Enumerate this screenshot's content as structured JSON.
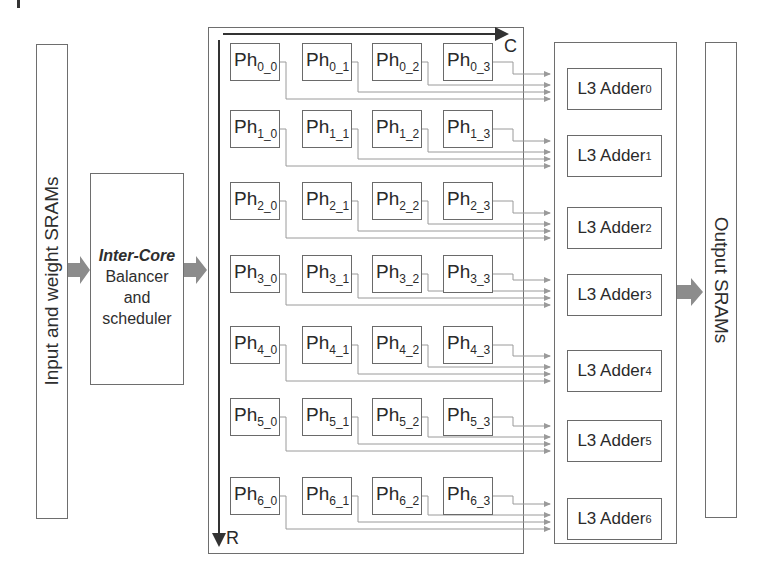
{
  "diagram": {
    "input_sram": {
      "label": "Input and weight SRAMs"
    },
    "balancer": {
      "title": "Inter-Core",
      "line1": "Balancer",
      "line2": "and",
      "line3": "scheduler"
    },
    "grid": {
      "col_axis_label": "C",
      "row_axis_label": "R",
      "prefix": "Ph",
      "rows": [
        [
          "0_0",
          "0_1",
          "0_2",
          "0_3"
        ],
        [
          "1_0",
          "1_1",
          "1_2",
          "1_3"
        ],
        [
          "2_0",
          "2_1",
          "2_2",
          "2_3"
        ],
        [
          "3_0",
          "3_1",
          "3_2",
          "3_3"
        ],
        [
          "4_0",
          "4_1",
          "4_2",
          "4_3"
        ],
        [
          "5_0",
          "5_1",
          "5_2",
          "5_3"
        ],
        [
          "6_0",
          "6_1",
          "6_2",
          "6_3"
        ]
      ]
    },
    "adders": {
      "label": "L3 Adder",
      "items": [
        {
          "sub": "0"
        },
        {
          "sub": "1"
        },
        {
          "sub": "2"
        },
        {
          "sub": "3"
        },
        {
          "sub": "4"
        },
        {
          "sub": "5"
        },
        {
          "sub": "6"
        }
      ]
    },
    "output_sram": {
      "label": "Output SRAMs"
    },
    "colors": {
      "box_border": "#6e6e6e",
      "arrow_fill": "#8c8c8c",
      "wire": "#9a9a9a",
      "text": "#2a2a2a"
    }
  }
}
